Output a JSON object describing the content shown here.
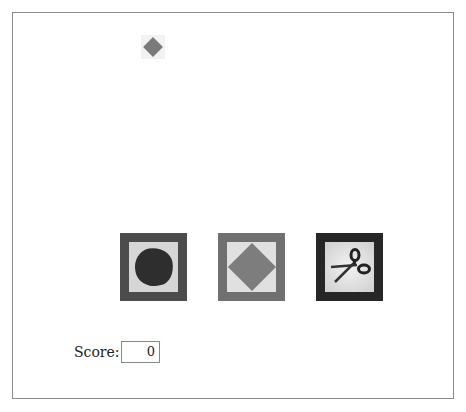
{
  "game": {
    "falling_item": "paper-diamond",
    "choices": [
      {
        "name": "rock",
        "label": "Rock"
      },
      {
        "name": "paper",
        "label": "Paper"
      },
      {
        "name": "scissors",
        "label": "Scissors"
      }
    ]
  },
  "score": {
    "label": "Score:",
    "value": "0"
  },
  "colors": {
    "rock_frame": "#4c4c4c",
    "paper_frame": "#707070",
    "scissors_frame": "#262626",
    "diamond": "#7a7a7a"
  }
}
